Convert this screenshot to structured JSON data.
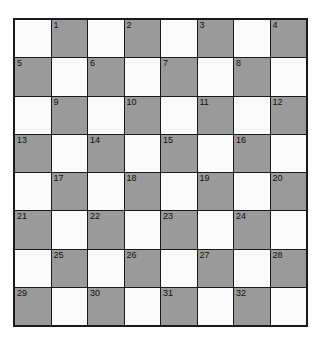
{
  "puzzle": {
    "type": "crossword-checkerboard",
    "rows": 8,
    "cols": 8,
    "colors": {
      "shaded": "#9a9a9a",
      "light": "#fbfbfb",
      "border": "#1a1a1a"
    },
    "cells": [
      [
        {
          "s": 0,
          "n": ""
        },
        {
          "s": 1,
          "n": "1"
        },
        {
          "s": 0,
          "n": ""
        },
        {
          "s": 1,
          "n": "2"
        },
        {
          "s": 0,
          "n": ""
        },
        {
          "s": 1,
          "n": "3"
        },
        {
          "s": 0,
          "n": ""
        },
        {
          "s": 1,
          "n": "4"
        }
      ],
      [
        {
          "s": 1,
          "n": "5"
        },
        {
          "s": 0,
          "n": ""
        },
        {
          "s": 1,
          "n": "6"
        },
        {
          "s": 0,
          "n": ""
        },
        {
          "s": 1,
          "n": "7"
        },
        {
          "s": 0,
          "n": ""
        },
        {
          "s": 1,
          "n": "8"
        },
        {
          "s": 0,
          "n": ""
        }
      ],
      [
        {
          "s": 0,
          "n": ""
        },
        {
          "s": 1,
          "n": "9"
        },
        {
          "s": 0,
          "n": ""
        },
        {
          "s": 1,
          "n": "10"
        },
        {
          "s": 0,
          "n": ""
        },
        {
          "s": 1,
          "n": "11"
        },
        {
          "s": 0,
          "n": ""
        },
        {
          "s": 1,
          "n": "12"
        }
      ],
      [
        {
          "s": 1,
          "n": "13"
        },
        {
          "s": 0,
          "n": ""
        },
        {
          "s": 1,
          "n": "14"
        },
        {
          "s": 0,
          "n": ""
        },
        {
          "s": 1,
          "n": "15"
        },
        {
          "s": 0,
          "n": ""
        },
        {
          "s": 1,
          "n": "16"
        },
        {
          "s": 0,
          "n": ""
        }
      ],
      [
        {
          "s": 0,
          "n": ""
        },
        {
          "s": 1,
          "n": "17"
        },
        {
          "s": 0,
          "n": ""
        },
        {
          "s": 1,
          "n": "18"
        },
        {
          "s": 0,
          "n": ""
        },
        {
          "s": 1,
          "n": "19"
        },
        {
          "s": 0,
          "n": ""
        },
        {
          "s": 1,
          "n": "20"
        }
      ],
      [
        {
          "s": 1,
          "n": "21"
        },
        {
          "s": 0,
          "n": ""
        },
        {
          "s": 1,
          "n": "22"
        },
        {
          "s": 0,
          "n": ""
        },
        {
          "s": 1,
          "n": "23"
        },
        {
          "s": 0,
          "n": ""
        },
        {
          "s": 1,
          "n": "24"
        },
        {
          "s": 0,
          "n": ""
        }
      ],
      [
        {
          "s": 0,
          "n": ""
        },
        {
          "s": 1,
          "n": "25"
        },
        {
          "s": 0,
          "n": ""
        },
        {
          "s": 1,
          "n": "26"
        },
        {
          "s": 0,
          "n": ""
        },
        {
          "s": 1,
          "n": "27"
        },
        {
          "s": 0,
          "n": ""
        },
        {
          "s": 1,
          "n": "28"
        }
      ],
      [
        {
          "s": 1,
          "n": "29"
        },
        {
          "s": 0,
          "n": ""
        },
        {
          "s": 1,
          "n": "30"
        },
        {
          "s": 0,
          "n": ""
        },
        {
          "s": 1,
          "n": "31"
        },
        {
          "s": 0,
          "n": ""
        },
        {
          "s": 1,
          "n": "32"
        },
        {
          "s": 0,
          "n": ""
        }
      ]
    ]
  }
}
